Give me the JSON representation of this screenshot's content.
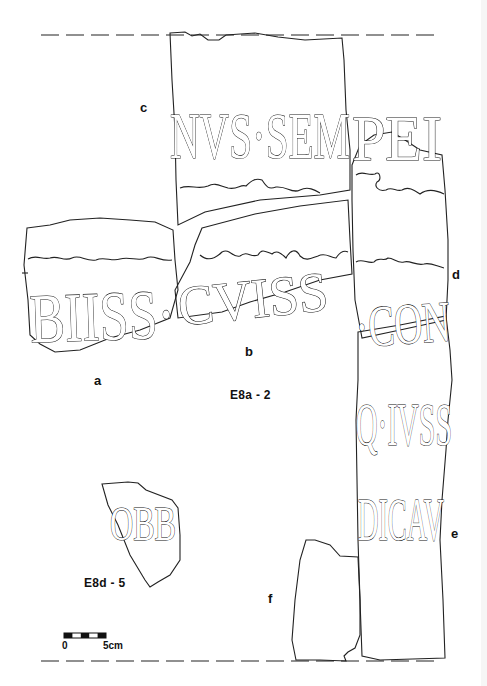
{
  "figure": {
    "type": "epigraphic fragment drawing",
    "colors": {
      "ink": "#111111",
      "background": "#ffffff"
    }
  },
  "fragments": [
    {
      "id": "a",
      "label": "a",
      "inscription": "BIISS·"
    },
    {
      "id": "b",
      "label": "b",
      "inscription": "CVISS"
    },
    {
      "id": "c",
      "label": "c",
      "inscription": "NVS·SEM"
    },
    {
      "id": "d",
      "label": "d",
      "inscription": "PEI"
    },
    {
      "id": "e",
      "label": "e",
      "inscription_lines": [
        "·CON",
        "Q·IVSS",
        "DICAV"
      ]
    },
    {
      "id": "f",
      "label": "f",
      "inscription": ""
    },
    {
      "id": "E8d-5",
      "label": "",
      "inscription": "OBB"
    }
  ],
  "catalog_labels": {
    "main_group": "E8a - 2",
    "small_fragment": "E8d - 5"
  },
  "scale_bar": {
    "start_label": "0",
    "end_label": "5cm"
  }
}
